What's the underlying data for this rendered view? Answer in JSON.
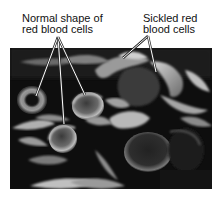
{
  "figure": {
    "labels": {
      "normal": {
        "line1": "Normal shape of",
        "line2": "red blood cells",
        "pointer_count": 3
      },
      "sickled": {
        "line1": "Sickled red",
        "line2": "blood cells",
        "pointer_count": 2
      }
    },
    "colors": {
      "background": "#ffffff",
      "photo_dark": "#0d0d0d",
      "cell_light": "#bdbdbd",
      "text": "#111111",
      "leader_line": "#ffffff"
    }
  }
}
